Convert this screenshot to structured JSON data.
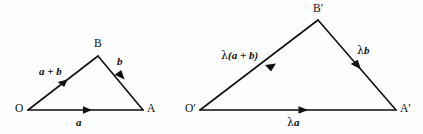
{
  "figure": {
    "background_color": "#fefefe",
    "stroke_color": "#111111",
    "text_color": "#0d0d0d",
    "width": 423,
    "height": 134
  },
  "diagram_data": {
    "type": "vector-diagram",
    "description": "Two similar triangles illustrating scalar multiplication of vectors: triangle O-A-B with vectors a, b, a+b and the scaled triangle O'-A'-B' with vectors lambda*a, lambda*b, lambda*(a+b).",
    "shapes": [
      {
        "name": "triangle-oab",
        "vertices": [
          {
            "name": "O",
            "label": "O",
            "x": 28,
            "y": 110
          },
          {
            "name": "A",
            "label": "A",
            "x": 143,
            "y": 110
          },
          {
            "name": "B",
            "label": "B",
            "x": 98,
            "y": 56
          }
        ],
        "edges": [
          {
            "name": "edge-o-a",
            "from": "O",
            "to": "A",
            "label": "a",
            "arrow": "mid-forward"
          },
          {
            "name": "edge-o-b",
            "from": "O",
            "to": "B",
            "label": "a + b",
            "arrow": "mid-forward"
          },
          {
            "name": "edge-b-a",
            "from": "B",
            "to": "A",
            "label": "b",
            "arrow": "mid-forward"
          }
        ]
      },
      {
        "name": "triangle-oab-prime",
        "vertices": [
          {
            "name": "O-prime",
            "label": "O′",
            "x": 200,
            "y": 110
          },
          {
            "name": "A-prime",
            "label": "A′",
            "x": 396,
            "y": 110
          },
          {
            "name": "B-prime",
            "label": "B′",
            "x": 318,
            "y": 20
          }
        ],
        "edges": [
          {
            "name": "edge-op-ap",
            "from": "O-prime",
            "to": "A-prime",
            "label": "λa",
            "arrow": "mid-forward"
          },
          {
            "name": "edge-op-bp",
            "from": "O-prime",
            "to": "B-prime",
            "label": "λ(a + b)",
            "arrow": "mid-forward"
          },
          {
            "name": "edge-bp-ap",
            "from": "B-prime",
            "to": "A-prime",
            "label": "λb",
            "arrow": "mid-forward"
          }
        ]
      }
    ]
  },
  "labels": {
    "vertex_o": "O",
    "vertex_a": "A",
    "vertex_b": "B",
    "vertex_o_prime": "O′",
    "vertex_a_prime": "A′",
    "vertex_b_prime": "B′",
    "vector_a": "a",
    "vector_b": "b",
    "vector_a_plus_b": "a + b",
    "lambda_symbol": "λ",
    "vector_lambda_a_rest": "a",
    "vector_lambda_b_rest": "b",
    "vector_lambda_a_plus_b_rest": "(a + b)"
  }
}
